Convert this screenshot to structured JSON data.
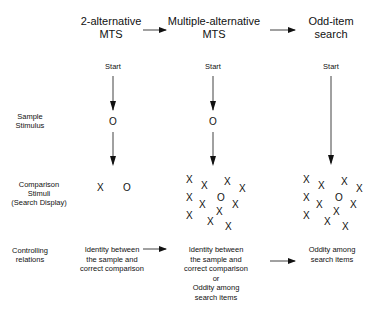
{
  "header": {
    "stages": [
      {
        "line1": "2-alternative",
        "line2": "MTS"
      },
      {
        "line1": "Multiple-alternative",
        "line2": "MTS"
      },
      {
        "line1": "Odd-item",
        "line2": "search"
      }
    ]
  },
  "start_label": "Start",
  "row_labels": {
    "sample": {
      "line1": "Sample",
      "line2": "Stimulus"
    },
    "comparison": {
      "line1": "Comparison",
      "line2": "Stimuli",
      "line3": "(Search Display)"
    },
    "controlling": {
      "line1": "Controlling",
      "line2": "relations"
    }
  },
  "sample_symbol": "O",
  "comparison": {
    "two_alt": [
      "X",
      "O"
    ],
    "multi_alt_symbols": [
      "X",
      "X",
      "X",
      "X",
      "X",
      "X",
      "O",
      "X",
      "X",
      "X",
      "X",
      "X",
      "X"
    ],
    "odd_item_symbols": [
      "X",
      "X",
      "X",
      "X",
      "X",
      "X",
      "O",
      "X",
      "X",
      "X",
      "X",
      "X",
      "X"
    ]
  },
  "controlling_relations": {
    "two_alt": [
      "Identity between",
      "the sample and",
      "correct comparison"
    ],
    "multi_alt": [
      "Identity between",
      "the sample and",
      "correct comparison",
      "or",
      "Oddity among",
      "search items"
    ],
    "odd_item": [
      "Oddity among",
      "search items"
    ]
  },
  "colors": {
    "ink": "#111111",
    "background": "#ffffff"
  }
}
